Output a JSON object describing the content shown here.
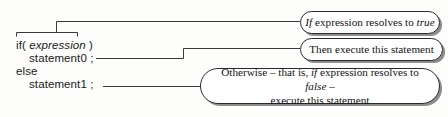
{
  "diagram": {
    "background_color": "#fdfdfc",
    "line_color": "#3a3a3a",
    "callout_border_color": "#2a2a2a",
    "callout_shadow_color": "#8e8e8e",
    "text_color": "#141414"
  },
  "code": {
    "line1_prefix": "if( ",
    "line1_italic": "expression",
    "line1_suffix": " )",
    "line2": "statement0 ;",
    "line3": "else",
    "line4": "statement1 ;"
  },
  "callouts": {
    "true_branch": {
      "part1_italic": "If",
      "part2": " expression resolves to ",
      "part3_italic": "true"
    },
    "then_branch": {
      "text": "Then execute this statement"
    },
    "else_branch": {
      "part1": "Otherwise – that is, ",
      "part2_italic": "if",
      "part3": " expression resolves to ",
      "part4_italic": "false",
      "part5": " –",
      "line2": "execute this statement"
    }
  }
}
